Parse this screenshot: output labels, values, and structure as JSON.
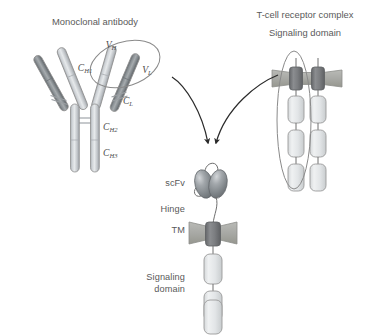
{
  "figure": {
    "title_monoclonal": "Monoclonal antibody",
    "title_tcr": "T-cell receptor complex",
    "title_tcr_sub": "Signaling domain"
  },
  "antibody": {
    "domains": [
      {
        "id": "vh",
        "base": "V",
        "sub": "H",
        "x": 111,
        "y": 48
      },
      {
        "id": "vl",
        "base": "V",
        "sub": "L",
        "x": 147,
        "y": 73
      },
      {
        "id": "ch1",
        "base": "C",
        "sub": "H1",
        "x": 85,
        "y": 71
      },
      {
        "id": "cl",
        "base": "C",
        "sub": "L",
        "x": 128,
        "y": 104
      },
      {
        "id": "ch2",
        "base": "C",
        "sub": "H2",
        "x": 103,
        "y": 130
      },
      {
        "id": "ch3",
        "base": "C",
        "sub": "H3",
        "x": 103,
        "y": 156
      }
    ]
  },
  "car": {
    "labels": [
      {
        "id": "scfv",
        "text": "scFv",
        "x": 185,
        "y": 186
      },
      {
        "id": "hinge",
        "text": "Hinge",
        "x": 185,
        "y": 212
      },
      {
        "id": "tm",
        "text": "TM",
        "x": 185,
        "y": 233
      }
    ],
    "signaling_label_line1": "Signaling",
    "signaling_label_line2": "domain",
    "signaling_label_x": 185,
    "signaling_label_y1": 280,
    "signaling_label_y2": 292,
    "signaling_box_count": 3
  },
  "tcr": {
    "chain_count": 2,
    "signaling_box_count": 3
  },
  "colors": {
    "background": "#ffffff",
    "heavy_chain_light": "#c9cdd2",
    "light_chain_dark": "#7d8488",
    "membrane_bar": "#a9aaa6",
    "tm_block": "#77787a",
    "signaling_box": "#e3e5e6",
    "outline": "#8f8f8f",
    "text": "#595959",
    "arrow": "#2b2b2b",
    "scfv_lobe": "#8d9296"
  }
}
